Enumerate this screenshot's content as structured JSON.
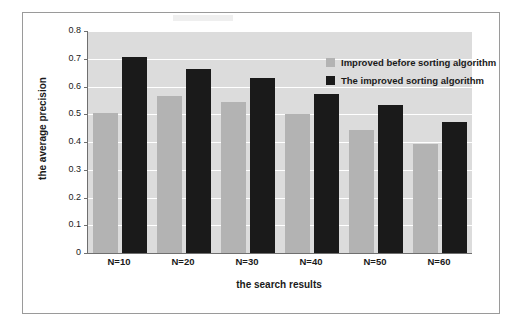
{
  "chart_data": {
    "type": "bar",
    "title": "",
    "xlabel": "the search results",
    "ylabel": "the average precision",
    "categories": [
      "N=10",
      "N=20",
      "N=30",
      "N=40",
      "N=50",
      "N=60"
    ],
    "series": [
      {
        "name": "Improved before sorting algorithm",
        "color": "#b3b3b3",
        "values": [
          0.505,
          0.565,
          0.545,
          0.502,
          0.442,
          0.392
        ]
      },
      {
        "name": "The improved sorting algorithm",
        "color": "#1a1a1a",
        "values": [
          0.705,
          0.663,
          0.632,
          0.572,
          0.535,
          0.473
        ]
      }
    ],
    "ylim": [
      0,
      0.8
    ],
    "ytick_labels": [
      "0",
      "0.1",
      "0.2",
      "0.3",
      "0.4",
      "0.5",
      "0.6",
      "0.7",
      "0.8"
    ],
    "ytick_values": [
      0,
      0.1,
      0.2,
      0.3,
      0.4,
      0.5,
      0.6,
      0.7,
      0.8
    ],
    "grid": true,
    "legend_position": "top-right",
    "plot_background": "#dcdcdc",
    "figure_background": "#ffffff",
    "border_color": "#9a9a9a"
  }
}
